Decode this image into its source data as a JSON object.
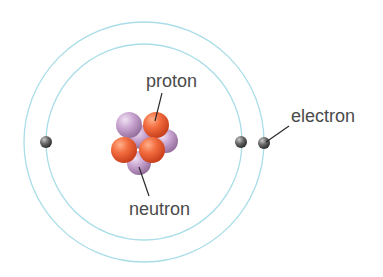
{
  "diagram": {
    "type": "atom-model",
    "labels": {
      "proton": "proton",
      "neutron": "neutron",
      "electron": "electron"
    },
    "colors": {
      "orbit": "#a9dde8",
      "proton": "#f06a3c",
      "neutron": "#c8a6cf",
      "electron": "#5c5c5c",
      "label": "#4a4a4a",
      "leader": "#2a2a2a",
      "background": "#ffffff"
    },
    "orbits": [
      {
        "name": "inner",
        "cx": 144,
        "cy": 142,
        "r": 98
      },
      {
        "name": "outer",
        "cx": 144,
        "cy": 142,
        "r": 120
      }
    ],
    "electrons": [
      {
        "cx": 46,
        "cy": 142
      },
      {
        "cx": 241,
        "cy": 142
      },
      {
        "cx": 264,
        "cy": 143
      }
    ],
    "nucleus": {
      "protons": 3,
      "neutrons": 4
    }
  }
}
